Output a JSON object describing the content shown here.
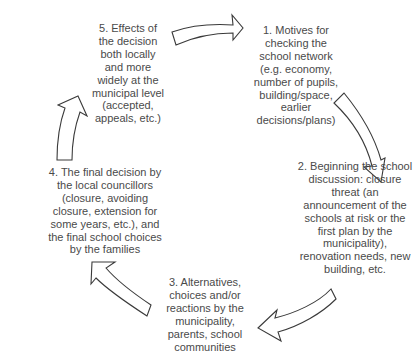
{
  "diagram": {
    "type": "cycle",
    "steps": [
      {
        "id": 1,
        "lines": [
          "1. Motives for",
          "checking  the",
          "school network",
          "(e.g. economy,",
          "number of pupils,",
          "building/space,",
          "earlier",
          "decisions/plans)"
        ]
      },
      {
        "id": 2,
        "lines": [
          "2. Beginning the school",
          "discussion: closure",
          "threat (an",
          "announcement of the",
          "schools at risk or the",
          "first plan by the",
          "municipality),",
          "renovation needs, new",
          "building, etc."
        ]
      },
      {
        "id": 3,
        "lines": [
          "3. Alternatives,",
          "choices and/or",
          "reactions by the",
          "municipality,",
          "parents, school",
          "communities"
        ]
      },
      {
        "id": 4,
        "lines": [
          "4. The final decision by",
          "the local councillors",
          "(closure, avoiding",
          "closure, extension for",
          "some years, etc.), and",
          "the final school choices",
          "by the families"
        ]
      },
      {
        "id": 5,
        "lines": [
          "5. Effects of",
          "the decision",
          "both locally",
          "and more",
          "widely at the",
          "municipal level",
          "(accepted,",
          "appeals, etc.)"
        ]
      }
    ],
    "arrows": [
      {
        "from": 5,
        "to": 1,
        "direction": "right"
      },
      {
        "from": 1,
        "to": 2,
        "direction": "down"
      },
      {
        "from": 2,
        "to": 3,
        "direction": "left"
      },
      {
        "from": 3,
        "to": 4,
        "direction": "up-left"
      },
      {
        "from": 4,
        "to": 5,
        "direction": "up"
      }
    ],
    "colors": {
      "text": "#4a4a4a",
      "arrow_stroke": "#3a3a3a",
      "arrow_fill": "#ffffff",
      "background": "#ffffff"
    }
  }
}
